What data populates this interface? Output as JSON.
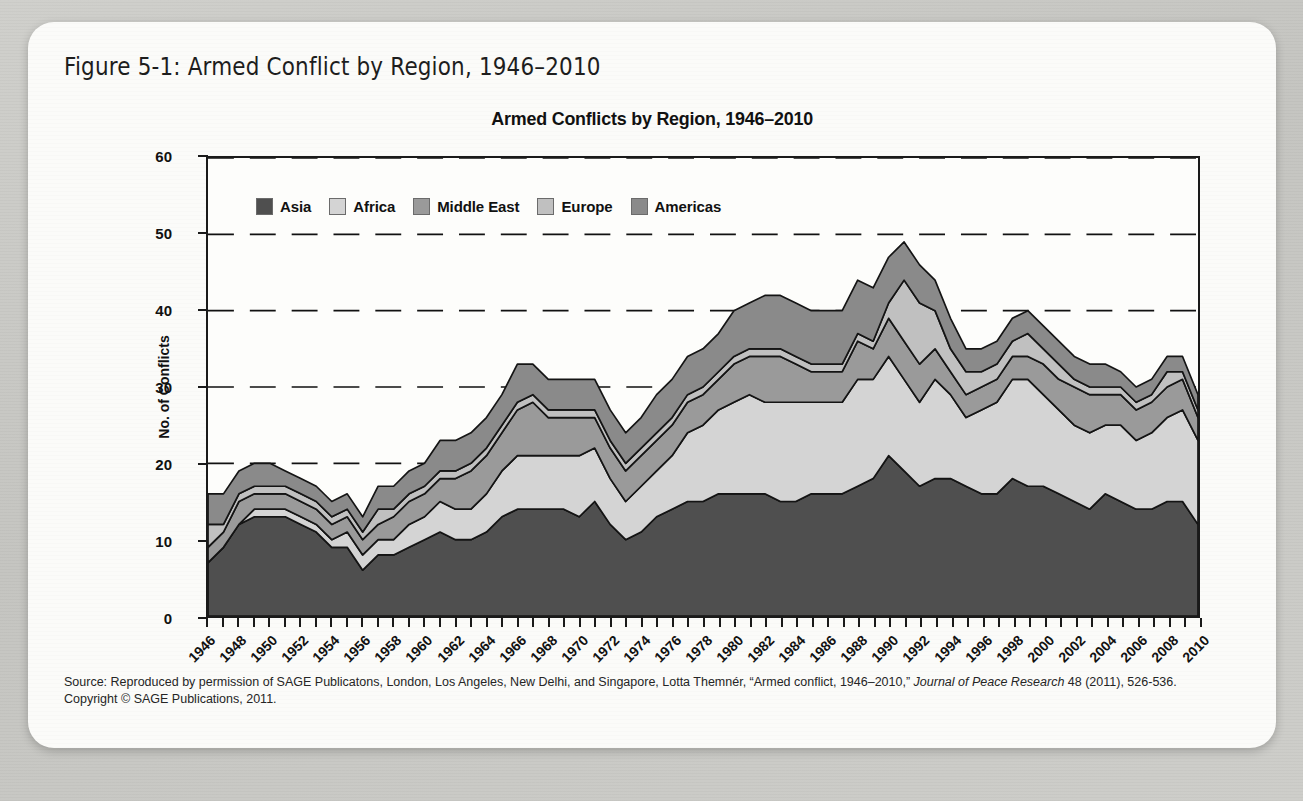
{
  "figure": {
    "caption": "Figure 5-1: Armed Conflict by Region, 1946–2010"
  },
  "chart_title": "Armed Conflicts by Region, 1946–2010",
  "axes": {
    "ylabel": "No. of Conflicts",
    "yticks": [
      "0",
      "10",
      "20",
      "30",
      "40",
      "50",
      "60"
    ],
    "xticks": [
      "1946",
      "1948",
      "1950",
      "1952",
      "1954",
      "1956",
      "1958",
      "1960",
      "1962",
      "1964",
      "1966",
      "1968",
      "1970",
      "1972",
      "1974",
      "1976",
      "1978",
      "1980",
      "1982",
      "1984",
      "1986",
      "1988",
      "1990",
      "1992",
      "1994",
      "1996",
      "1998",
      "2000",
      "2002",
      "2004",
      "2006",
      "2008",
      "2010"
    ]
  },
  "legend": {
    "items": [
      {
        "label": "Asia",
        "color": "#4f4f4f"
      },
      {
        "label": "Africa",
        "color": "#d4d4d4"
      },
      {
        "label": "Middle East",
        "color": "#9a9a9a"
      },
      {
        "label": "Europe",
        "color": "#c0c0c0"
      },
      {
        "label": "Americas",
        "color": "#8a8a8a"
      }
    ]
  },
  "source": {
    "line1_pre": "Source: Reproduced by permission of SAGE Publicatons, London, Los Angeles, New Delhi, and Singapore, Lotta Themnér, “Armed conflict, 1946–2010,” ",
    "line1_italic": "Journal of Peace Research",
    "line1_post": " 48 (2011), 526-536.",
    "line2": "Copyright © SAGE Publications, 2011."
  },
  "chart_data": {
    "type": "area",
    "stacked": true,
    "title": "Armed Conflicts by Region, 1946–2010",
    "xlabel": "",
    "ylabel": "No. of Conflicts",
    "ylim": [
      0,
      60
    ],
    "ytick_step": 10,
    "grid": "horizontal-dashed",
    "legend_position": "top-left-inside",
    "x": [
      1946,
      1947,
      1948,
      1949,
      1950,
      1951,
      1952,
      1953,
      1954,
      1955,
      1956,
      1957,
      1958,
      1959,
      1960,
      1961,
      1962,
      1963,
      1964,
      1965,
      1966,
      1967,
      1968,
      1969,
      1970,
      1971,
      1972,
      1973,
      1974,
      1975,
      1976,
      1977,
      1978,
      1979,
      1980,
      1981,
      1982,
      1983,
      1984,
      1985,
      1986,
      1987,
      1988,
      1989,
      1990,
      1991,
      1992,
      1993,
      1994,
      1995,
      1996,
      1997,
      1998,
      1999,
      2000,
      2001,
      2002,
      2003,
      2004,
      2005,
      2006,
      2007,
      2008,
      2009,
      2010
    ],
    "series": [
      {
        "name": "Asia",
        "color": "#4f4f4f",
        "values": [
          7,
          9,
          12,
          13,
          13,
          13,
          12,
          11,
          9,
          9,
          6,
          8,
          8,
          9,
          10,
          11,
          10,
          10,
          11,
          13,
          14,
          14,
          14,
          14,
          13,
          15,
          12,
          10,
          11,
          13,
          14,
          15,
          15,
          16,
          16,
          16,
          16,
          15,
          15,
          16,
          16,
          16,
          17,
          18,
          21,
          19,
          17,
          18,
          18,
          17,
          16,
          16,
          18,
          17,
          17,
          16,
          15,
          14,
          16,
          15,
          14,
          14,
          15,
          15,
          12
        ]
      },
      {
        "name": "Africa",
        "color": "#d4d4d4",
        "values": [
          0,
          0,
          0,
          1,
          1,
          1,
          1,
          1,
          1,
          2,
          2,
          2,
          2,
          3,
          3,
          4,
          4,
          4,
          5,
          6,
          7,
          7,
          7,
          7,
          8,
          7,
          6,
          5,
          6,
          6,
          7,
          9,
          10,
          11,
          12,
          13,
          12,
          13,
          13,
          12,
          12,
          12,
          14,
          13,
          13,
          12,
          11,
          13,
          11,
          9,
          11,
          12,
          13,
          14,
          12,
          11,
          10,
          10,
          9,
          10,
          9,
          10,
          11,
          12,
          11
        ]
      },
      {
        "name": "Middle East",
        "color": "#9a9a9a",
        "values": [
          2,
          2,
          3,
          2,
          2,
          2,
          2,
          2,
          2,
          2,
          2,
          2,
          3,
          3,
          3,
          3,
          4,
          5,
          5,
          5,
          6,
          7,
          5,
          5,
          5,
          4,
          4,
          4,
          4,
          4,
          4,
          4,
          4,
          4,
          5,
          5,
          6,
          6,
          5,
          4,
          4,
          4,
          5,
          4,
          5,
          5,
          5,
          4,
          3,
          3,
          3,
          3,
          3,
          3,
          4,
          4,
          5,
          5,
          4,
          4,
          4,
          4,
          4,
          4,
          3
        ]
      },
      {
        "name": "Europe",
        "color": "#c0c0c0",
        "values": [
          3,
          1,
          1,
          1,
          1,
          1,
          1,
          1,
          1,
          1,
          1,
          2,
          1,
          1,
          1,
          1,
          1,
          1,
          1,
          1,
          1,
          1,
          1,
          1,
          1,
          1,
          1,
          1,
          1,
          1,
          1,
          1,
          1,
          1,
          1,
          1,
          1,
          1,
          1,
          1,
          1,
          1,
          1,
          1,
          2,
          8,
          8,
          5,
          3,
          3,
          2,
          2,
          2,
          3,
          2,
          2,
          1,
          1,
          1,
          1,
          1,
          1,
          2,
          1,
          1
        ]
      },
      {
        "name": "Americas",
        "color": "#8a8a8a",
        "values": [
          4,
          4,
          3,
          3,
          3,
          2,
          2,
          2,
          2,
          2,
          2,
          3,
          3,
          3,
          3,
          4,
          4,
          4,
          4,
          4,
          5,
          4,
          4,
          4,
          4,
          4,
          4,
          4,
          4,
          5,
          5,
          5,
          5,
          5,
          6,
          6,
          7,
          7,
          7,
          7,
          7,
          7,
          7,
          7,
          6,
          5,
          5,
          4,
          4,
          3,
          3,
          3,
          3,
          3,
          3,
          3,
          3,
          3,
          3,
          2,
          2,
          2,
          2,
          2,
          2
        ]
      }
    ],
    "totals": [
      16,
      16,
      19,
      20,
      20,
      19,
      18,
      17,
      15,
      16,
      13,
      17,
      17,
      19,
      20,
      23,
      23,
      24,
      26,
      29,
      33,
      33,
      31,
      31,
      31,
      31,
      27,
      24,
      26,
      29,
      31,
      34,
      35,
      37,
      40,
      41,
      42,
      42,
      41,
      40,
      40,
      40,
      44,
      43,
      47,
      49,
      46,
      44,
      39,
      35,
      35,
      36,
      39,
      40,
      38,
      36,
      34,
      33,
      33,
      32,
      30,
      31,
      34,
      34,
      29
    ],
    "peak": {
      "year": 1991,
      "value": 49
    }
  }
}
